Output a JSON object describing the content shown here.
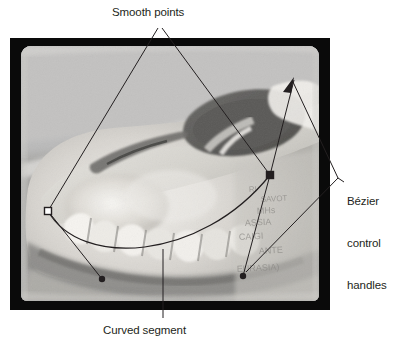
{
  "figure": {
    "kind": "annotated-photograph-diagram",
    "background_color": "#ffffff",
    "frame_color": "#0a0a0a",
    "annotation_color": "#231f20",
    "photo_subject": "grayscale photograph of an animal skull in profile showing jaw and teeth",
    "photo_handwriting": [
      "RI",
      "SAVOT",
      "MHs",
      "ASSIA",
      "CAIGI",
      "ANTE",
      "EURASIA)"
    ]
  },
  "annotations": {
    "smooth_points": {
      "label": "Smooth points",
      "marker": "anchor-square"
    },
    "bezier_handles": {
      "label_line_1": "Bézier",
      "label_line_2": "control",
      "label_line_3": "handles",
      "marker": "handle-dot"
    },
    "curved_segment": {
      "label": "Curved segment",
      "marker": "curve-stroke"
    }
  },
  "path": {
    "anchor_left": {
      "x": 48,
      "y": 211,
      "style": "hollow-square"
    },
    "anchor_right": {
      "x": 270,
      "y": 175,
      "style": "filled-square"
    },
    "handle_left_end": {
      "x": 102,
      "y": 279
    },
    "handle_right_end": {
      "x": 243,
      "y": 276
    },
    "arrow_tip": {
      "x": 294,
      "y": 78
    }
  }
}
